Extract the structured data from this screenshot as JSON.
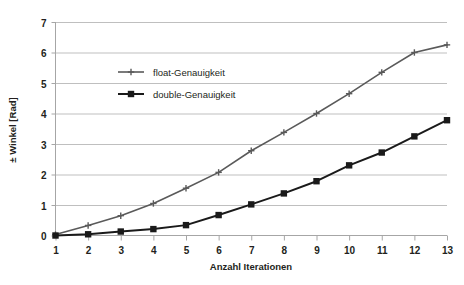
{
  "chart_data": {
    "type": "line",
    "title": "",
    "xlabel": "Anzahl Iterationen",
    "ylabel": "± Winkel [Rad]",
    "x": [
      1,
      2,
      3,
      4,
      5,
      6,
      7,
      8,
      9,
      10,
      11,
      12,
      13
    ],
    "xticklabels": [
      "1",
      "2",
      "3",
      "4",
      "5",
      "6",
      "7",
      "8",
      "9",
      "10",
      "11",
      "12",
      "13"
    ],
    "yticklabels": [
      "0",
      "1",
      "2",
      "3",
      "4",
      "5",
      "6",
      "7"
    ],
    "xlim": [
      1,
      13
    ],
    "ylim": [
      0,
      7
    ],
    "ytick_step": 1,
    "grid": "horizontal",
    "legend_position": "inside-upper-left",
    "series": [
      {
        "name": "float-Genauigkeit",
        "color": "#5a5a5a",
        "marker": "plus",
        "values": [
          0.03,
          0.33,
          0.65,
          1.05,
          1.55,
          2.07,
          2.78,
          3.38,
          4.0,
          4.65,
          5.35,
          6.0,
          6.25
        ]
      },
      {
        "name": "double-Genauigkeit",
        "color": "#1a1a1a",
        "marker": "square",
        "values": [
          0.0,
          0.04,
          0.13,
          0.21,
          0.34,
          0.67,
          1.02,
          1.38,
          1.78,
          2.3,
          2.72,
          3.25,
          3.78
        ]
      }
    ]
  },
  "legend": {
    "entries": [
      {
        "label": "float-Genauigkeit"
      },
      {
        "label": "double-Genauigkeit"
      }
    ]
  },
  "axes": {
    "x_title": "Anzahl Iterationen",
    "y_title": "± Winkel [Rad]"
  },
  "colors": {
    "grid": "#bfbfbf",
    "axis": "#a6a6a6",
    "float_series": "#5a5a5a",
    "double_series": "#1a1a1a",
    "text": "#231f20",
    "background": "#ffffff"
  }
}
